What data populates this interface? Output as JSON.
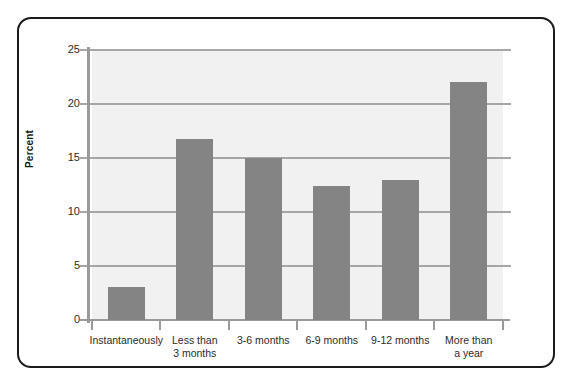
{
  "chart_data": {
    "type": "bar",
    "title": "",
    "subtitle": "",
    "xlabel": "",
    "ylabel": "Percent",
    "categories": [
      "Instantaneously",
      "Less than\n3 months",
      "3-6 months",
      "6-9 months",
      "9-12 months",
      "More than\na year"
    ],
    "values": [
      3.1,
      16.8,
      15.0,
      12.4,
      13.0,
      22.0
    ],
    "ylim": [
      0,
      25
    ],
    "ytick_labels": [
      "0",
      "5",
      "10",
      "15",
      "20",
      "25"
    ],
    "ytick_values": [
      0,
      5,
      10,
      15,
      20,
      25
    ],
    "grid": "horizontal",
    "legend": "none",
    "bar_color": "#848484",
    "plot_background": "#f1f1f1",
    "gridline_color": "#a6a6a6",
    "axis_color": "#9a9a9a",
    "frame_color": "#1a1a1a",
    "text_color": "#2b2b2b"
  }
}
